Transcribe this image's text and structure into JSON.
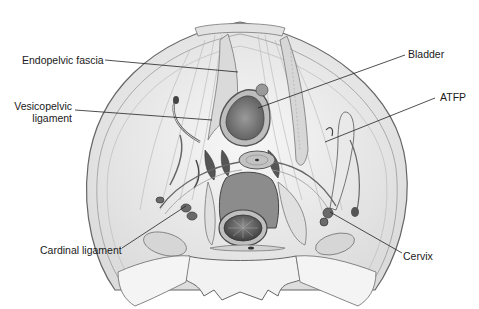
{
  "figure": {
    "labels": {
      "endopelvic_fascia": "Endopelvic fascia",
      "vesicopelvic_line1": "Vesicopelvic",
      "vesicopelvic_line2": "ligament",
      "bladder": "Bladder",
      "atfp": "ATFP",
      "cardinal_ligament": "Cardinal ligament",
      "cervix": "Cervix"
    },
    "colors": {
      "outline": "#555555",
      "fill_light": "#ececec",
      "fill_mid": "#cfcfcf",
      "fill_dark": "#7a7a7a",
      "leader_line": "#222222",
      "text": "#1a1a1a"
    }
  }
}
